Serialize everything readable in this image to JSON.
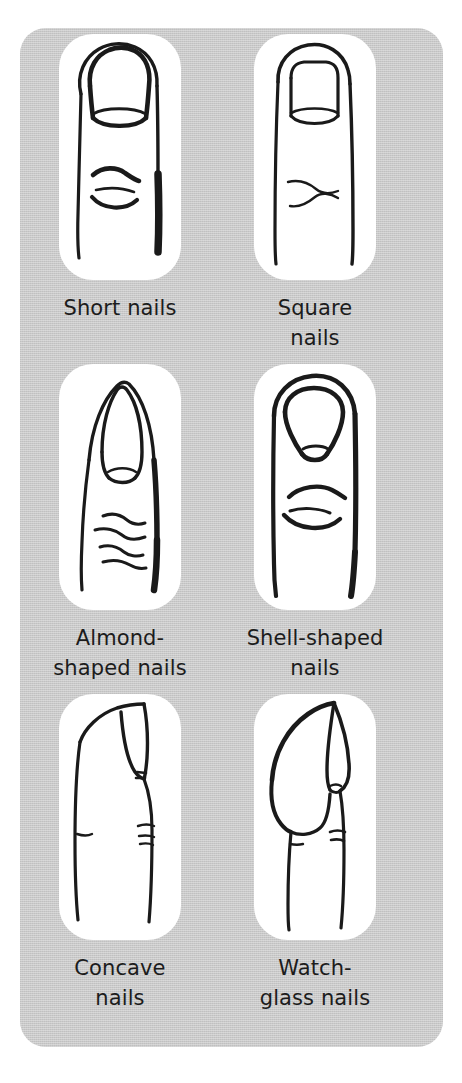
{
  "figure": {
    "panel_color": "#c9c9c9",
    "card_color": "#ffffff",
    "ink_color": "#1a1a1a",
    "columns": 2,
    "rows": 3
  },
  "cells": [
    {
      "id": "short-nails",
      "icon": "finger-front-short-nail-icon",
      "caption_lines": [
        "Short nails"
      ],
      "row": 1,
      "column": "left"
    },
    {
      "id": "square-nails",
      "icon": "finger-front-square-nail-icon",
      "caption_lines": [
        "Square",
        "nails"
      ],
      "row": 1,
      "column": "right"
    },
    {
      "id": "almond-shaped-nails",
      "icon": "finger-front-almond-nail-icon",
      "caption_lines": [
        "Almond-",
        "shaped nails"
      ],
      "row": 2,
      "column": "left"
    },
    {
      "id": "shell-shaped-nails",
      "icon": "finger-front-shell-nail-icon",
      "caption_lines": [
        "Shell-shaped",
        "nails"
      ],
      "row": 2,
      "column": "right"
    },
    {
      "id": "concave-nails",
      "icon": "finger-profile-concave-nail-icon",
      "caption_lines": [
        "Concave",
        "nails"
      ],
      "row": 3,
      "column": "left"
    },
    {
      "id": "watch-glass-nails",
      "icon": "finger-profile-watchglass-nail-icon",
      "caption_lines": [
        "Watch-",
        "glass nails"
      ],
      "row": 3,
      "column": "right"
    }
  ]
}
